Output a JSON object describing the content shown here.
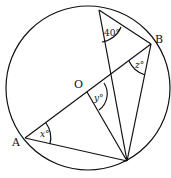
{
  "diagram": {
    "points": {
      "A": {
        "label": "A"
      },
      "B": {
        "label": "B"
      },
      "O": {
        "label": "O"
      }
    },
    "angles": {
      "top": "40°",
      "x": "x°",
      "y": "y°",
      "z": "z°"
    }
  }
}
